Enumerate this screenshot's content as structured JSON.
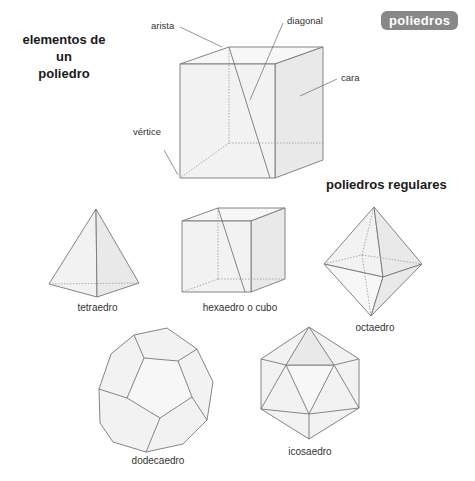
{
  "header": {
    "badge": "poliedros",
    "badge_color": "#888888"
  },
  "elements_section": {
    "title_line1": "elementos de un",
    "title_line2": "poliedro",
    "labels": {
      "arista": "arista",
      "diagonal": "diagonal",
      "cara": "cara",
      "vertice": "vértice"
    }
  },
  "regular_section": {
    "title": "poliedros regulares",
    "solids": [
      {
        "name": "tetraedro"
      },
      {
        "name": "hexaedro o cubo"
      },
      {
        "name": "octaedro"
      },
      {
        "name": "dodecaedro"
      },
      {
        "name": "icosaedro"
      }
    ]
  }
}
